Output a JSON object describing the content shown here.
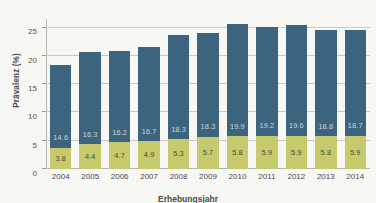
{
  "chart_data": {
    "type": "bar",
    "subtype": "stacked-bar",
    "title": "",
    "xlabel": "Erhebungsjahr",
    "ylabel": "Prävalenz (%)",
    "categories": [
      "2004",
      "2005",
      "2006",
      "2007",
      "2008",
      "2009",
      "2010",
      "2011",
      "2012",
      "2013",
      "2014"
    ],
    "series": [
      {
        "name": "untere Komponente",
        "color": "#c6ca6d",
        "values": [
          3.8,
          4.4,
          4.7,
          4.9,
          5.3,
          5.7,
          5.8,
          5.9,
          5.9,
          5.8,
          5.9
        ]
      },
      {
        "name": "obere Komponente",
        "color": "#3d647f",
        "values": [
          14.6,
          16.3,
          16.2,
          16.7,
          18.3,
          18.3,
          19.9,
          19.2,
          19.6,
          18.8,
          18.7
        ]
      }
    ],
    "totals": [
      18.4,
      20.7,
      20.9,
      21.6,
      23.6,
      24.0,
      25.7,
      25.1,
      25.5,
      24.6,
      24.6
    ],
    "ylim": [
      0,
      26.5
    ],
    "yticks": [
      0,
      5,
      10,
      15,
      20,
      25
    ],
    "ytick_labels": [
      "0",
      "5",
      "10",
      "15",
      "20",
      "25"
    ],
    "grid": true,
    "grid_axis": "y",
    "legend": "none",
    "background_color": "#f7f7f4"
  },
  "axes": {
    "y_title": "Prävalenz (%)",
    "x_title_partial": "Erhebungsjahr"
  }
}
